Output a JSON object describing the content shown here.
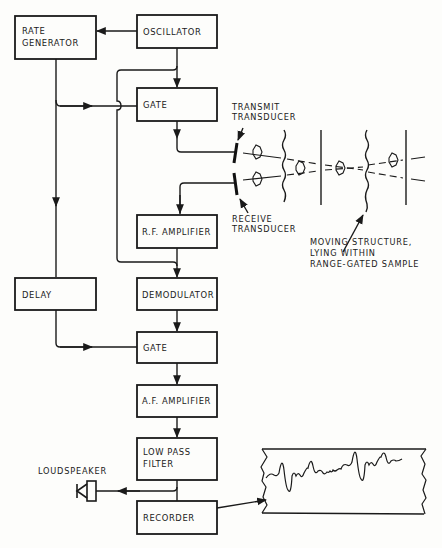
{
  "diagram": {
    "type": "block-diagram",
    "blocks": [
      {
        "id": "rate_generator",
        "lines": [
          "RATE",
          "GENERATOR"
        ]
      },
      {
        "id": "oscillator",
        "lines": [
          "OSCILLATOR"
        ]
      },
      {
        "id": "gate1",
        "lines": [
          "GATE"
        ]
      },
      {
        "id": "rf_amplifier",
        "lines": [
          "R.F. AMPLIFIER"
        ]
      },
      {
        "id": "delay",
        "lines": [
          "DELAY"
        ]
      },
      {
        "id": "demodulator",
        "lines": [
          "DEMODULATOR"
        ]
      },
      {
        "id": "gate2",
        "lines": [
          "GATE"
        ]
      },
      {
        "id": "af_amplifier",
        "lines": [
          "A.F. AMPLIFIER"
        ]
      },
      {
        "id": "low_pass_filter",
        "lines": [
          "LOW PASS",
          "FILTER"
        ]
      },
      {
        "id": "recorder",
        "lines": [
          "RECORDER"
        ]
      }
    ],
    "annotations": {
      "transmit": [
        "TRANSMIT",
        "TRANSDUCER"
      ],
      "receive": [
        "RECEIVE",
        "TRANSDUCER"
      ],
      "moving": [
        "MOVING STRUCTURE,",
        "LYING WITHIN",
        "RANGE-GATED SAMPLE"
      ],
      "loudspeaker": "LOUDSPEAKER"
    },
    "connections": [
      {
        "from": "oscillator",
        "to": "rate_generator"
      },
      {
        "from": "oscillator",
        "to": "gate1"
      },
      {
        "from": "rate_generator",
        "to": "gate1"
      },
      {
        "from": "gate1",
        "to": "transmit_transducer"
      },
      {
        "from": "receive_transducer",
        "to": "rf_amplifier"
      },
      {
        "from": "oscillator",
        "to": "demodulator"
      },
      {
        "from": "rf_amplifier",
        "to": "demodulator"
      },
      {
        "from": "rate_generator",
        "to": "delay"
      },
      {
        "from": "delay",
        "to": "gate2"
      },
      {
        "from": "demodulator",
        "to": "gate2"
      },
      {
        "from": "gate2",
        "to": "af_amplifier"
      },
      {
        "from": "af_amplifier",
        "to": "low_pass_filter"
      },
      {
        "from": "low_pass_filter",
        "to": "loudspeaker"
      },
      {
        "from": "low_pass_filter",
        "to": "recorder"
      },
      {
        "from": "recorder",
        "to": "chart_strip"
      }
    ]
  }
}
